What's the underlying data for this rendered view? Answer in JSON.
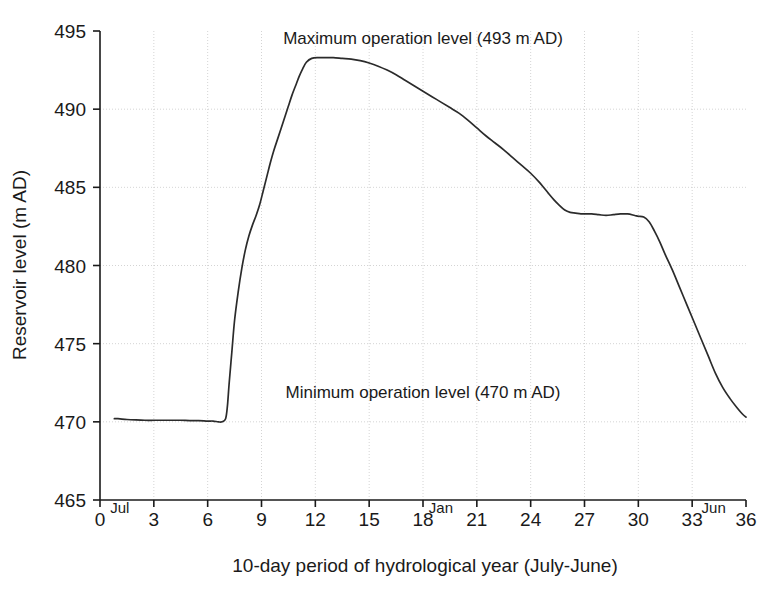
{
  "chart_data": {
    "type": "line",
    "title": "",
    "xlabel": "10-day period of hydrological year (July-June)",
    "ylabel": "Reservoir level (m AD)",
    "xlim": [
      0,
      36
    ],
    "ylim": [
      465,
      495
    ],
    "xticks": [
      0,
      3,
      6,
      9,
      12,
      15,
      18,
      21,
      24,
      27,
      30,
      33,
      36
    ],
    "yticks": [
      465,
      470,
      475,
      480,
      485,
      490,
      495
    ],
    "grid": true,
    "legend": "none",
    "month_markers": [
      {
        "label": "Jul",
        "x": 1.1
      },
      {
        "label": "Jan",
        "x": 19.0
      },
      {
        "label": "Jun",
        "x": 34.2
      }
    ],
    "annotations": [
      {
        "name": "maximum-operation-level",
        "text": "Maximum operation level (493 m AD)",
        "x": 18.0,
        "y": 494.2
      },
      {
        "name": "minimum-operation-level",
        "text": "Minimum operation level (470 m AD)",
        "x": 18.0,
        "y": 471.5
      }
    ],
    "series": [
      {
        "name": "Reservoir level",
        "color": "#2b2b2b",
        "x": [
          0.8,
          1.0,
          1.5,
          2.0,
          2.5,
          3.0,
          3.5,
          4.0,
          4.5,
          5.0,
          5.5,
          6.0,
          6.3,
          6.6,
          6.8,
          7.0,
          7.1,
          7.2,
          7.35,
          7.5,
          7.7,
          7.9,
          8.1,
          8.3,
          8.5,
          8.7,
          8.9,
          9.1,
          9.3,
          9.5,
          9.7,
          9.9,
          10.1,
          10.3,
          10.5,
          10.7,
          10.9,
          11.1,
          11.3,
          11.5,
          11.8,
          12.2,
          12.6,
          13.0,
          13.5,
          14.0,
          14.5,
          15.0,
          15.5,
          16.0,
          16.5,
          17.0,
          17.5,
          18.0,
          18.5,
          19.0,
          19.5,
          20.0,
          20.5,
          21.0,
          21.5,
          22.0,
          22.5,
          23.0,
          23.5,
          24.0,
          24.5,
          25.0,
          25.3,
          25.6,
          25.9,
          26.2,
          26.5,
          26.8,
          27.1,
          27.4,
          27.8,
          28.2,
          28.6,
          29.0,
          29.4,
          29.8,
          30.0,
          30.3,
          30.6,
          30.9,
          31.2,
          31.5,
          31.9,
          32.3,
          32.7,
          33.1,
          33.5,
          33.9,
          34.3,
          34.7,
          35.1,
          35.5,
          35.8,
          36.0
        ],
        "y": [
          470.2,
          470.2,
          470.15,
          470.12,
          470.1,
          470.1,
          470.1,
          470.1,
          470.1,
          470.08,
          470.08,
          470.05,
          470.05,
          470.0,
          470.0,
          470.2,
          471.0,
          472.5,
          474.5,
          476.5,
          478.3,
          479.8,
          481.0,
          481.9,
          482.6,
          483.2,
          483.9,
          484.8,
          485.7,
          486.6,
          487.4,
          488.1,
          488.8,
          489.5,
          490.2,
          490.9,
          491.5,
          492.1,
          492.6,
          493.0,
          493.25,
          493.3,
          493.3,
          493.3,
          493.25,
          493.2,
          493.1,
          492.95,
          492.75,
          492.5,
          492.2,
          491.85,
          491.5,
          491.15,
          490.8,
          490.45,
          490.1,
          489.75,
          489.3,
          488.8,
          488.3,
          487.85,
          487.4,
          486.9,
          486.4,
          485.9,
          485.3,
          484.6,
          484.2,
          483.85,
          483.55,
          483.4,
          483.35,
          483.3,
          483.3,
          483.3,
          483.25,
          483.2,
          483.25,
          483.3,
          483.3,
          483.2,
          483.15,
          483.1,
          482.8,
          482.2,
          481.5,
          480.7,
          479.7,
          478.6,
          477.5,
          476.4,
          475.3,
          474.2,
          473.1,
          472.2,
          471.5,
          470.9,
          470.5,
          470.3
        ]
      }
    ]
  },
  "axes": {
    "y_tick_labels": [
      "495",
      "490",
      "485",
      "480",
      "475",
      "470",
      "465"
    ],
    "x_tick_labels": [
      "0",
      "3",
      "6",
      "9",
      "12",
      "15",
      "18",
      "21",
      "24",
      "27",
      "30",
      "33",
      "36"
    ]
  }
}
